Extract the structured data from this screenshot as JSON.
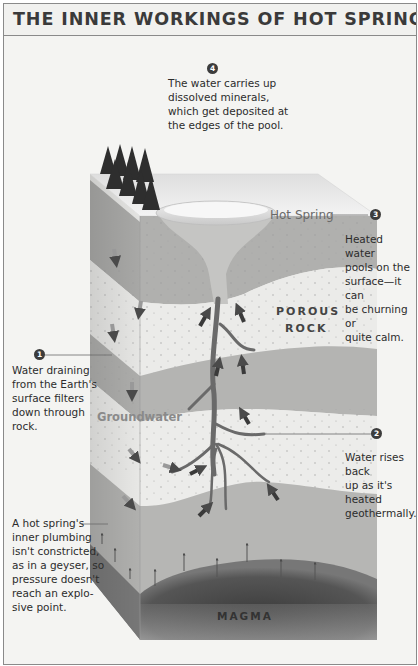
{
  "title": "THE INNER WORKINGS OF HOT SPRINGS",
  "labels": {
    "hot_spring": "Hot Spring",
    "porous_rock_line1": "POROUS",
    "porous_rock_line2": "ROCK",
    "groundwater": "Groundwater",
    "magma": "MAGMA"
  },
  "callouts": [
    {
      "number": "1",
      "text_lines": [
        "Water draining",
        "from the Earth's",
        "surface filters",
        "down through",
        "rock."
      ]
    },
    {
      "number": "2",
      "text_lines": [
        "Water rises back",
        "up as it's heated",
        "geothermally."
      ]
    },
    {
      "number": "3",
      "text_lines": [
        "Heated water",
        "pools on the",
        "surface—it can",
        "be churning or",
        "quite calm."
      ]
    },
    {
      "number": "4",
      "text_lines": [
        "The water carries up",
        "dissolved minerals,",
        "which get deposited at",
        "the edges of the pool."
      ]
    },
    {
      "number": "",
      "text_lines": [
        "A hot spring's",
        "inner plumbing",
        "isn't constricted,",
        "as in a geyser, so",
        "pressure doesn't",
        "reach an explo-",
        "sive point."
      ]
    }
  ],
  "colors": {
    "frame_border": "#8a8a8a",
    "background": "#f4f4f2",
    "title_text": "#3a3a3a",
    "rock_dark": "#a9a9a9",
    "rock_light": "#e4e4e2",
    "magma": "#4a4a4a",
    "arrow": "#3a3a3a"
  }
}
